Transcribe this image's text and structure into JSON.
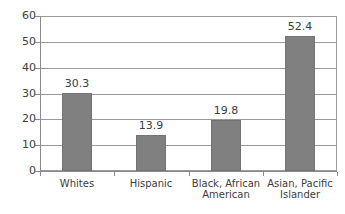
{
  "chart_data": {
    "type": "bar",
    "title": "",
    "subtitle": "",
    "xlabel": "",
    "ylabel": "",
    "categories": [
      "Whites",
      "Black, African American",
      "Hispanic",
      "Asian, Pacific Islander"
    ],
    "category_display": [
      [
        "Whites"
      ],
      [
        "Hispanic"
      ],
      [
        "Black, African",
        "American"
      ],
      [
        "Asian, Pacific",
        "Islander"
      ]
    ],
    "ordered_categories": [
      "Whites",
      "Hispanic",
      "Black, African American",
      "Asian, Pacific Islander"
    ],
    "values": [
      30.3,
      13.9,
      19.8,
      52.4
    ],
    "value_labels": [
      "30.3",
      "13.9",
      "19.8",
      "52.4"
    ],
    "ylim": [
      0,
      60
    ],
    "ytick_values": [
      0,
      10,
      20,
      30,
      40,
      50,
      60
    ],
    "ytick_labels": [
      "0",
      "10",
      "20",
      "30",
      "40",
      "50",
      "60"
    ],
    "grid": true,
    "grid_axis": "y",
    "legend": false,
    "legend_position": "none",
    "bar_color": "#808080",
    "bar_border_color": "#737373",
    "grid_color": "#9a9a9a",
    "axis_color": "#8a8a8a",
    "text_color": "#3d3d3d",
    "background": "#ffffff"
  }
}
